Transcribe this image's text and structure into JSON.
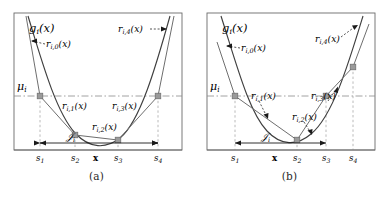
{
  "figure": {
    "background": "#ffffff",
    "curve_color": "#3f3f3f",
    "secant_color": "#6e6e6e",
    "marker_color": "#8c8c8c",
    "grid_color": "#9a9a9a",
    "frame_color": "#6b6b6b",
    "text_color": "#1a1a1a"
  },
  "panels": [
    {
      "id": "a",
      "caption": "(a)",
      "curve_label": "g_i(x)",
      "mean_label": "μ_i",
      "interval_label": "J_i",
      "point_label": "x",
      "ticks": [
        "s_1",
        "s_2",
        "x",
        "s_3",
        "s_4"
      ],
      "tick_positions": [
        40,
        75,
        97,
        118,
        158
      ],
      "segment_labels": [
        {
          "name": "r0",
          "text": "r_{i,0}(x)",
          "x": 46,
          "y": 44
        },
        {
          "name": "r1",
          "text": "r_{i,1}(x)",
          "x": 72,
          "y": 106
        },
        {
          "name": "r2",
          "text": "r_{i,2}(x)",
          "x": 104,
          "y": 131
        },
        {
          "name": "r3",
          "text": "r_{i,3}(x)",
          "x": 118,
          "y": 110
        },
        {
          "name": "r4",
          "text": "r_{i,4}(x)",
          "x": 146,
          "y": 31
        }
      ],
      "knots": [
        {
          "name": "s1",
          "x": 40,
          "y": 96
        },
        {
          "name": "s2",
          "x": 75,
          "y": 135
        },
        {
          "name": "s3",
          "x": 118,
          "y": 140
        },
        {
          "name": "s4",
          "x": 158,
          "y": 96
        }
      ],
      "mu_level_y": 96,
      "interval_from": "s_1",
      "interval_to": "s_4"
    },
    {
      "id": "b",
      "caption": "(b)",
      "curve_label": "g_i(x)",
      "mean_label": "μ_i",
      "interval_label": "J_i",
      "point_label": "x",
      "ticks": [
        "s_1",
        "x",
        "s_2",
        "s_3",
        "s_4"
      ],
      "tick_positions": [
        42,
        82,
        104,
        133,
        160
      ],
      "segment_labels": [
        {
          "name": "r0",
          "text": "r_{i,0}(x)",
          "x": 48,
          "y": 48
        },
        {
          "name": "r1",
          "text": "r_{i,1}(x)",
          "x": 70,
          "y": 97
        },
        {
          "name": "r2",
          "text": "r_{i,2}(x)",
          "x": 104,
          "y": 117
        },
        {
          "name": "r3",
          "text": "r_{i,3}(x)",
          "x": 124,
          "y": 97
        },
        {
          "name": "r4",
          "text": "r_{i,4}(x)",
          "x": 134,
          "y": 40
        }
      ],
      "knots": [
        {
          "name": "s1",
          "x": 42,
          "y": 96
        },
        {
          "name": "s2",
          "x": 104,
          "y": 140
        },
        {
          "name": "s3",
          "x": 133,
          "y": 96
        },
        {
          "name": "s4",
          "x": 160,
          "y": 67
        }
      ],
      "mu_level_y": 96,
      "interval_from": "s_1",
      "interval_to": "s_3"
    }
  ]
}
